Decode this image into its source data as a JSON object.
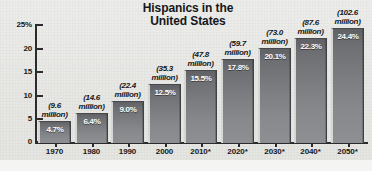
{
  "chart_data": {
    "type": "bar",
    "title": "Hispanics in the United States",
    "title_line1": "Hispanics in the",
    "title_line2": "United States",
    "xlabel": "",
    "ylabel": "",
    "ylim": [
      0,
      25
    ],
    "grid": false,
    "legend": "none",
    "y_ticks": [
      "25%",
      "20",
      "15",
      "10",
      "5",
      "0"
    ],
    "y_tick_values": [
      25,
      20,
      15,
      10,
      5,
      0
    ],
    "categories": [
      "1970",
      "1980",
      "1990",
      "2000",
      "2010*",
      "2020*",
      "2030*",
      "2040*",
      "2050*"
    ],
    "values": [
      4.7,
      6.4,
      9.0,
      12.5,
      15.5,
      17.8,
      20.1,
      22.3,
      24.4
    ],
    "value_labels": [
      "4.7%",
      "6.4%",
      "9.0%",
      "12.5%",
      "15.5%",
      "17.8%",
      "20.1%",
      "22.3%",
      "24.4%"
    ],
    "population_millions": [
      9.6,
      14.6,
      22.4,
      35.3,
      47.8,
      59.7,
      73.0,
      87.6,
      102.6
    ],
    "annotations": [
      {
        "line1": "(9.6",
        "line2": "million)"
      },
      {
        "line1": "(14.6",
        "line2": "million)"
      },
      {
        "line1": "(22.4",
        "line2": "million)"
      },
      {
        "line1": "(35.3",
        "line2": "million)"
      },
      {
        "line1": "(47.8",
        "line2": "million)"
      },
      {
        "line1": "(59.7",
        "line2": "million)"
      },
      {
        "line1": "(73.0",
        "line2": "million)"
      },
      {
        "line1": "(87.6",
        "line2": "million)"
      },
      {
        "line1": "(102.6",
        "line2": "million)"
      }
    ],
    "colors": {
      "background": "#e8e8e6",
      "bar_top": "#5f6164",
      "bar_bottom": "#8d8f92",
      "bar_highlight": "#d6d6d4",
      "axis": "#2b2b2b",
      "text": "#17181a",
      "value_text": "#ffffff"
    }
  }
}
